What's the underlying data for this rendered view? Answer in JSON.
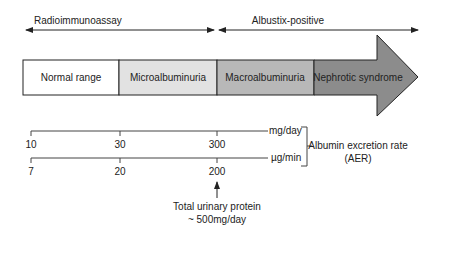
{
  "ranges": {
    "radioimmunoassay": "Radioimmunoassay",
    "albustix": "Albustix-positive"
  },
  "stages": [
    {
      "label": "Normal range",
      "color": "#ffffff"
    },
    {
      "label": "Microalbuminuria",
      "color": "#e2e2e2"
    },
    {
      "label": "Macroalbuminuria",
      "color": "#b8b8b8"
    },
    {
      "label": "Nephrotic syndrome",
      "color": "#8c8c8c"
    }
  ],
  "scales": {
    "mg_day": {
      "unit": "mg/day",
      "ticks": [
        "10",
        "30",
        "300"
      ]
    },
    "ug_min": {
      "unit": "µg/min",
      "ticks": [
        "7",
        "20",
        "200"
      ]
    }
  },
  "aer_label": {
    "line1": "Albumin excretion rate",
    "line2": "(AER)"
  },
  "annotation": {
    "line1": "Total urinary protein",
    "line2": "~ 500mg/day"
  }
}
